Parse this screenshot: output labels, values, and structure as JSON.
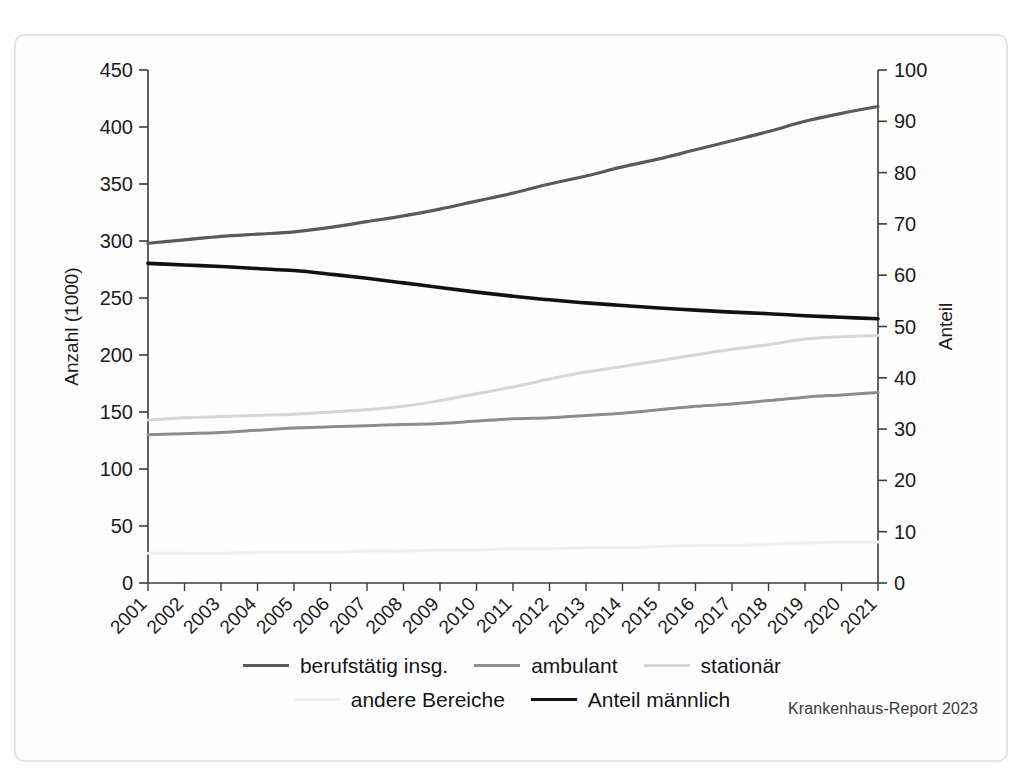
{
  "figure": {
    "source_note": "Krankenhaus-Report 2023",
    "background_color": "#ffffff",
    "frame_color": "#e2e2e2"
  },
  "chart_data": {
    "type": "line",
    "title": "",
    "subtitle": "",
    "xlabel": "",
    "ylabel": "Anzahl (1000)",
    "y2label": "Anteil",
    "grid": false,
    "legend_position": "bottom",
    "xlim": [
      2001,
      2021
    ],
    "ylim": [
      0,
      450
    ],
    "y2lim": [
      0,
      100
    ],
    "yticks": [
      0,
      50,
      100,
      150,
      200,
      250,
      300,
      350,
      400,
      450
    ],
    "y2ticks": [
      0,
      10,
      20,
      30,
      40,
      50,
      60,
      70,
      80,
      90,
      100
    ],
    "x": [
      2001,
      2002,
      2003,
      2004,
      2005,
      2006,
      2007,
      2008,
      2009,
      2010,
      2011,
      2012,
      2013,
      2014,
      2015,
      2016,
      2017,
      2018,
      2019,
      2020,
      2021
    ],
    "categories": [
      "2001",
      "2002",
      "2003",
      "2004",
      "2005",
      "2006",
      "2007",
      "2008",
      "2009",
      "2010",
      "2011",
      "2012",
      "2013",
      "2014",
      "2015",
      "2016",
      "2017",
      "2018",
      "2019",
      "2020",
      "2021"
    ],
    "series": [
      {
        "name": "berufstätig insg.",
        "axis": "left",
        "color": "#5a5a5a",
        "width": 3.2,
        "values": [
          298,
          301,
          304,
          306,
          308,
          312,
          317,
          322,
          328,
          335,
          342,
          350,
          357,
          365,
          372,
          380,
          388,
          396,
          405,
          412,
          418
        ]
      },
      {
        "name": "ambulant",
        "axis": "left",
        "color": "#8d8d8d",
        "width": 3.0,
        "values": [
          130,
          131,
          132,
          134,
          136,
          137,
          138,
          139,
          140,
          142,
          144,
          145,
          147,
          149,
          152,
          155,
          157,
          160,
          163,
          165,
          167
        ]
      },
      {
        "name": "stationär",
        "axis": "left",
        "color": "#d6d6d6",
        "width": 3.0,
        "values": [
          143,
          145,
          146,
          147,
          148,
          150,
          152,
          155,
          160,
          166,
          172,
          179,
          185,
          190,
          195,
          200,
          205,
          209,
          214,
          216,
          217
        ]
      },
      {
        "name": "andere Bereiche",
        "axis": "left",
        "color": "#efefef",
        "width": 3.0,
        "values": [
          26,
          26,
          26,
          27,
          27,
          27,
          28,
          28,
          29,
          29,
          30,
          30,
          31,
          31,
          32,
          33,
          33,
          34,
          35,
          36,
          36
        ]
      },
      {
        "name": "Anteil männlich",
        "axis": "right",
        "color": "#111111",
        "width": 3.6,
        "values": [
          62.3,
          62.0,
          61.7,
          61.3,
          60.9,
          60.2,
          59.4,
          58.5,
          57.6,
          56.7,
          55.9,
          55.2,
          54.6,
          54.1,
          53.6,
          53.2,
          52.8,
          52.5,
          52.1,
          51.8,
          51.5
        ]
      }
    ]
  },
  "legend": {
    "rows": [
      [
        {
          "label": "berufstätig insg.",
          "color": "#5a5a5a",
          "width": 3.2
        },
        {
          "label": "ambulant",
          "color": "#8d8d8d",
          "width": 3.0
        },
        {
          "label": "stationär",
          "color": "#d6d6d6",
          "width": 3.0
        }
      ],
      [
        {
          "label": "andere Bereiche",
          "color": "#efefef",
          "width": 3.0
        },
        {
          "label": "Anteil männlich",
          "color": "#111111",
          "width": 3.6
        }
      ]
    ]
  }
}
